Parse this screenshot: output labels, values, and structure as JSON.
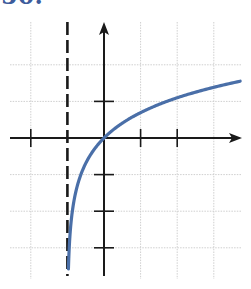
{
  "problem": {
    "label": "50."
  },
  "chart_data": {
    "type": "line",
    "title": "",
    "xlabel": "",
    "ylabel": "",
    "function": "y = ln(x + 1)",
    "grid": true,
    "xlim": [
      -2,
      3.7
    ],
    "ylim": [
      -3.7,
      3.2
    ],
    "x_ticks": [
      -2,
      1,
      2
    ],
    "y_ticks": [
      1,
      -1,
      -2,
      -3
    ],
    "vertical_asymptote": {
      "x": -1,
      "style": "dashed"
    },
    "series": [
      {
        "name": "f(x)",
        "color": "#4a6fa8",
        "x": [
          -0.975,
          -0.9,
          -0.75,
          -0.5,
          0,
          0.5,
          1,
          2,
          3,
          3.7
        ],
        "y": [
          -3.69,
          -2.3,
          -1.39,
          -0.69,
          0,
          0.41,
          0.69,
          1.1,
          1.39,
          1.55
        ]
      }
    ]
  },
  "colors": {
    "curve": "#4a6fa8",
    "axes": "#1a1a1a",
    "grid": "#cfcfcf",
    "label": "#3d5c9c"
  }
}
